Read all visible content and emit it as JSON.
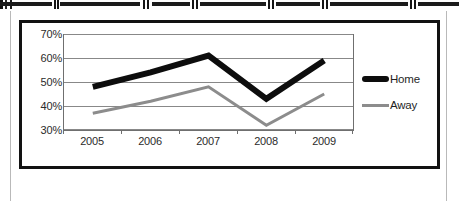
{
  "chart_data": {
    "type": "line",
    "title": "",
    "xlabel": "",
    "ylabel": "",
    "categories": [
      "2005",
      "2006",
      "2007",
      "2008",
      "2009"
    ],
    "ytick_labels": [
      "70%",
      "60%",
      "50%",
      "40%",
      "30%"
    ],
    "ylim": [
      25,
      75
    ],
    "ytick_values": [
      70,
      60,
      50,
      40,
      30
    ],
    "grid": true,
    "legend_position": "right",
    "series": [
      {
        "name": "Home",
        "color": "#0d0d0d",
        "line_width": 6,
        "values": [
          48,
          54,
          61,
          43,
          59
        ]
      },
      {
        "name": "Away",
        "color": "#8c8c8c",
        "line_width": 3,
        "values": [
          37,
          42,
          48,
          32,
          45
        ]
      }
    ]
  },
  "legend": {
    "items": [
      {
        "label": "Home",
        "swatch": "home"
      },
      {
        "label": "Away",
        "swatch": "away"
      }
    ]
  }
}
